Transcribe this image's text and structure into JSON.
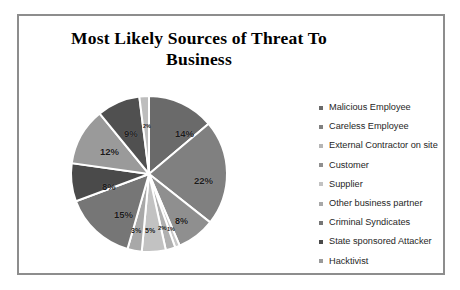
{
  "chart_title": "Most Likely Sources of Threat To Business",
  "title_line1": "Most Likely Sources of Threat To",
  "title_line2": "Business",
  "frame": {
    "border_color": "#8d8d8d",
    "background": "#ffffff"
  },
  "legend": {
    "items": [
      {
        "label": "Malicious Employee",
        "color": "#6a6a6a"
      },
      {
        "label": "Careless Employee",
        "color": "#808080"
      },
      {
        "label": "External Contractor on site",
        "color": "#b5b5b5"
      },
      {
        "label": "Customer",
        "color": "#8f8f8f"
      },
      {
        "label": "Supplier",
        "color": "#c2c2c2"
      },
      {
        "label": "Other business partner",
        "color": "#a8a8a8"
      },
      {
        "label": "Criminal Syndicates",
        "color": "#767676"
      },
      {
        "label": "State sponsored Attacker",
        "color": "#4a4a4a"
      },
      {
        "label": "Hacktivist",
        "color": "#9a9a9a"
      }
    ]
  },
  "chart_data": {
    "type": "pie",
    "title": "Most Likely Sources of Threat To Business",
    "legend_position": "right",
    "grid": false,
    "start_angle_deg": 0,
    "direction": "clockwise",
    "categories": [
      "Malicious Employee",
      "Careless Employee",
      "External Contractor on site",
      "Customer",
      "Supplier",
      "Other business partner",
      "Criminal Syndicates",
      "State sponsored Attacker",
      "Hacktivist"
    ],
    "values": [
      14,
      22,
      8,
      3,
      5,
      2,
      15,
      8,
      12
    ],
    "labels": [
      "14%",
      "22%",
      "8%",
      "3%",
      "5%",
      "2%",
      "15%",
      "8%",
      "12%"
    ],
    "extra_slivers": [
      {
        "label": "9%",
        "value": 9
      },
      {
        "label": "2%",
        "value": 2
      },
      {
        "label": "1%",
        "value": 1
      }
    ],
    "slices": [
      {
        "label": "14%",
        "value": 14,
        "color": "#6a6a6a"
      },
      {
        "label": "22%",
        "value": 22,
        "color": "#808080"
      },
      {
        "label": "8%",
        "value": 8,
        "color": "#8f8f8f"
      },
      {
        "label": "1%",
        "value": 1,
        "color": "#c9c9c9"
      },
      {
        "label": "2%",
        "value": 2,
        "color": "#b0b0b0"
      },
      {
        "label": "5%",
        "value": 5,
        "color": "#c2c2c2"
      },
      {
        "label": "3%",
        "value": 3,
        "color": "#a8a8a8"
      },
      {
        "label": "15%",
        "value": 15,
        "color": "#767676"
      },
      {
        "label": "8%",
        "value": 8,
        "color": "#4a4a4a"
      },
      {
        "label": "12%",
        "value": 12,
        "color": "#9a9a9a"
      },
      {
        "label": "9%",
        "value": 9,
        "color": "#505050"
      },
      {
        "label": "2%",
        "value": 2,
        "color": "#bdbdbd"
      }
    ],
    "pie_labels": {
      "p14": "14%",
      "p22": "22%",
      "p8b": "8%",
      "p1": "1%",
      "p2b": "2%",
      "p5": "5%",
      "p3": "3%",
      "p15": "15%",
      "p8a": "8%",
      "p12": "12%",
      "p9": "9%",
      "p2t": "2%"
    }
  }
}
